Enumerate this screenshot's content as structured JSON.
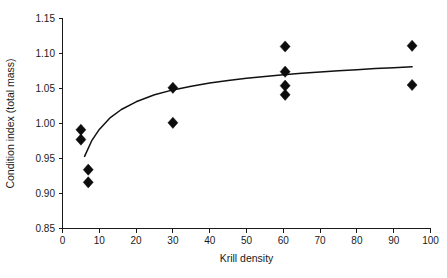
{
  "chart_data": {
    "type": "scatter",
    "title": "",
    "xlabel": "Krill density",
    "ylabel": "Condition index (total mass)",
    "xlim": [
      0,
      100
    ],
    "ylim": [
      0.85,
      1.15
    ],
    "xticks": [
      0,
      10,
      20,
      30,
      40,
      50,
      60,
      70,
      80,
      90,
      100
    ],
    "xticklabels": [
      "0",
      "10",
      "20",
      "30",
      "40",
      "50",
      "60",
      "70",
      "80",
      "90",
      "100"
    ],
    "yticks": [
      0.85,
      0.9,
      0.95,
      1.0,
      1.05,
      1.1,
      1.15
    ],
    "yticklabels": [
      "0.85",
      "0.90",
      "0.95",
      "1.00",
      "1.05",
      "1.10",
      "1.15"
    ],
    "grid": false,
    "legend": false,
    "marker": "diamond",
    "marker_color": "#0d0d0d",
    "points": [
      {
        "x": 5.0,
        "y": 0.991
      },
      {
        "x": 5.0,
        "y": 0.977
      },
      {
        "x": 7.0,
        "y": 0.934
      },
      {
        "x": 7.0,
        "y": 0.916
      },
      {
        "x": 30.0,
        "y": 1.051
      },
      {
        "x": 30.0,
        "y": 1.001
      },
      {
        "x": 60.5,
        "y": 1.11
      },
      {
        "x": 60.5,
        "y": 1.074
      },
      {
        "x": 60.5,
        "y": 1.054
      },
      {
        "x": 60.5,
        "y": 1.041
      },
      {
        "x": 95.0,
        "y": 1.111
      },
      {
        "x": 95.0,
        "y": 1.055
      }
    ],
    "fit_curve": {
      "name": "logarithmic fit",
      "color": "#111111",
      "x": [
        6.0,
        8.0,
        10.0,
        13.0,
        16.0,
        20.0,
        25.0,
        30.0,
        35.0,
        40.0,
        45.0,
        50.0,
        55.0,
        60.0,
        65.0,
        70.0,
        75.0,
        80.0,
        85.0,
        90.0,
        95.0
      ],
      "y": [
        0.953,
        0.976,
        0.9915,
        1.0085,
        1.02,
        1.031,
        1.041,
        1.048,
        1.0533,
        1.0577,
        1.0613,
        1.0645,
        1.0672,
        1.0696,
        1.0717,
        1.0736,
        1.0753,
        1.0769,
        1.0784,
        1.0797,
        1.081
      ]
    }
  }
}
